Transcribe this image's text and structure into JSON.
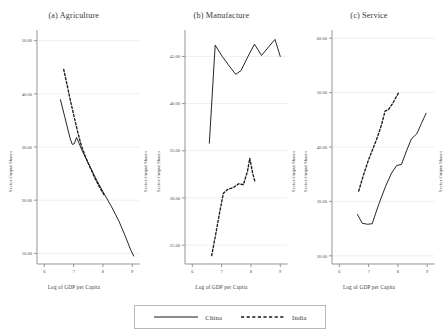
{
  "figure": {
    "xlabel": "Log of GDP per Capita",
    "ylabel": "Sector Output Shares",
    "background": "#ffffff",
    "line_color": "#1a1a1a",
    "grid_color": "#e8e8e8",
    "axis_color": "#8a8a8a"
  },
  "legend": {
    "china_label": "China",
    "india_label": "India",
    "china_style": "solid",
    "india_style": "dashed"
  },
  "chart_data": [
    {
      "type": "line",
      "title": "(a) Agriculture",
      "xlabel": "Log of GDP per Capita",
      "ylabel": "Sector Output Shares",
      "xlim": [
        5.75,
        9.25
      ],
      "ylim": [
        8.0,
        52.0
      ],
      "xticks": [
        6,
        7,
        8,
        9
      ],
      "xtick_labels": [
        "6",
        "7",
        "8",
        "9"
      ],
      "yticks": [
        10,
        20,
        30,
        40,
        50
      ],
      "ytick_labels": [
        "10.00",
        "20.00",
        "30.00",
        "40.00",
        "50.00"
      ],
      "grid": true,
      "legend_position": "below-figure",
      "series": [
        {
          "name": "China",
          "style": "solid",
          "x": [
            6.55,
            6.7,
            6.88,
            6.95,
            7.02,
            7.1,
            7.3,
            7.55,
            7.8,
            8.05,
            8.3,
            8.55,
            8.75,
            8.95,
            9.05
          ],
          "y": [
            38.9,
            35.6,
            31.6,
            30.5,
            30.6,
            31.8,
            29.2,
            26.4,
            23.6,
            21.1,
            18.7,
            16.0,
            13.4,
            10.6,
            9.5
          ]
        },
        {
          "name": "India",
          "style": "dashed",
          "x": [
            6.66,
            6.78,
            6.9,
            7.02,
            7.14,
            7.26,
            7.4,
            7.55,
            7.72,
            7.9,
            8.05
          ],
          "y": [
            44.6,
            41.6,
            38.5,
            35.6,
            32.8,
            30.3,
            28.2,
            26.3,
            24.2,
            22.3,
            20.9
          ]
        }
      ]
    },
    {
      "type": "line",
      "title": "(b) Manufacture",
      "xlabel": "Log of GDP per Capita",
      "ylabel": "Sector Output Shares",
      "xlim": [
        5.75,
        9.25
      ],
      "ylim": [
        23.0,
        47.8
      ],
      "xticks": [
        6,
        7,
        8,
        9
      ],
      "xtick_labels": [
        "6",
        "7",
        "8",
        "9"
      ],
      "yticks": [
        25,
        30,
        35,
        40,
        45
      ],
      "ytick_labels": [
        "25.00",
        "30.00",
        "35.00",
        "40.00",
        "45.00"
      ],
      "grid": true,
      "legend_position": "below-figure",
      "series": [
        {
          "name": "China",
          "style": "solid",
          "x": [
            6.58,
            6.78,
            7.02,
            7.28,
            7.48,
            7.66,
            7.9,
            8.12,
            8.36,
            8.6,
            8.82,
            9.0
          ],
          "y": [
            35.8,
            46.2,
            45.0,
            43.9,
            43.1,
            43.5,
            45.0,
            46.3,
            45.1,
            46.0,
            46.8,
            45.0
          ]
        },
        {
          "name": "India",
          "style": "dashed",
          "x": [
            6.66,
            6.8,
            6.94,
            7.06,
            7.2,
            7.4,
            7.58,
            7.74,
            7.88,
            7.96,
            8.06,
            8.14
          ],
          "y": [
            23.9,
            26.2,
            28.6,
            30.5,
            30.9,
            31.1,
            31.5,
            31.4,
            32.8,
            34.2,
            32.6,
            31.7
          ]
        }
      ]
    },
    {
      "type": "line",
      "title": "(c) Service",
      "xlabel": "Log of GDP per Capita",
      "ylabel": "Sector Output Shares",
      "xlim": [
        5.75,
        9.25
      ],
      "ylim": [
        18.5,
        61.5
      ],
      "xticks": [
        6,
        7,
        8,
        9
      ],
      "xtick_labels": [
        "6",
        "7",
        "8",
        "9"
      ],
      "yticks": [
        20,
        30,
        40,
        50,
        60
      ],
      "ytick_labels": [
        "20.00",
        "30.00",
        "40.00",
        "50.00",
        "60.00"
      ],
      "grid": true,
      "legend_position": "below-figure",
      "series": [
        {
          "name": "China",
          "style": "solid",
          "x": [
            6.62,
            6.78,
            6.96,
            7.12,
            7.34,
            7.58,
            7.78,
            7.96,
            8.12,
            8.3,
            8.46,
            8.64,
            8.8,
            8.96
          ],
          "y": [
            27.6,
            26.0,
            25.8,
            25.9,
            29.4,
            32.8,
            35.2,
            36.6,
            36.8,
            39.4,
            41.5,
            42.4,
            44.3,
            46.2
          ]
        },
        {
          "name": "India",
          "style": "dashed",
          "x": [
            6.66,
            6.82,
            6.98,
            7.14,
            7.3,
            7.44,
            7.56,
            7.68,
            7.82,
            7.94,
            8.04
          ],
          "y": [
            31.9,
            34.8,
            37.4,
            39.6,
            41.8,
            44.1,
            46.6,
            46.9,
            48.0,
            49.2,
            50.1
          ]
        }
      ]
    }
  ]
}
